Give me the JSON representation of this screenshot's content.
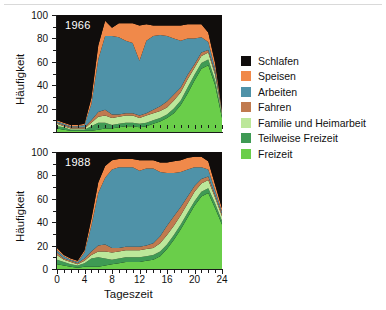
{
  "figure": {
    "panels": [
      {
        "id": "1966",
        "annotation": "1966"
      },
      {
        "id": "1988",
        "annotation": "1988"
      }
    ],
    "axes": {
      "xlabel": "Tageszeit",
      "ylabel": "Häufigkeit",
      "xticks": [
        0,
        4,
        8,
        12,
        16,
        20,
        24
      ],
      "yticks_top": [
        20,
        40,
        60,
        80,
        100
      ],
      "yticks_bottom": [
        0,
        20,
        40,
        60,
        80,
        100
      ],
      "xlim": [
        0,
        24
      ],
      "ylim": [
        0,
        100
      ]
    }
  },
  "legend": {
    "position": "right",
    "items": [
      {
        "label": "Schlafen",
        "color": "#100d0c"
      },
      {
        "label": "Speisen",
        "color": "#f0894a"
      },
      {
        "label": "Arbeiten",
        "color": "#4f92a8"
      },
      {
        "label": "Fahren",
        "color": "#c07a4f"
      },
      {
        "label": "Familie und Heimarbeit",
        "color": "#bce79a"
      },
      {
        "label": "Teilweise Freizeit",
        "color": "#3f9a54"
      },
      {
        "label": "Freizeit",
        "color": "#6ace4a"
      }
    ]
  },
  "chart_data": {
    "type": "area",
    "title": "",
    "xlabel": "Tageszeit",
    "ylabel": "Häufigkeit",
    "xlim": [
      0,
      24
    ],
    "ylim": [
      0,
      100
    ],
    "grid": false,
    "stacked": true,
    "stack_order_bottom_to_top": [
      "Freizeit",
      "Teilweise Freizeit",
      "Familie und Heimarbeit",
      "Fahren",
      "Arbeiten",
      "Speisen",
      "Schlafen"
    ],
    "x": [
      0,
      1,
      2,
      3,
      4,
      5,
      6,
      7,
      8,
      9,
      10,
      11,
      12,
      13,
      14,
      15,
      16,
      17,
      18,
      19,
      20,
      21,
      22,
      23,
      24
    ],
    "panels": [
      {
        "name": "1966",
        "annotation": "1966",
        "series": [
          {
            "name": "Freizeit",
            "values": [
              3,
              2,
              1,
              1,
              1,
              1,
              2,
              3,
              3,
              4,
              5,
              5,
              4,
              5,
              7,
              9,
              12,
              16,
              23,
              33,
              44,
              54,
              57,
              40,
              12
            ]
          },
          {
            "name": "Teilweise Freizeit",
            "values": [
              2,
              2,
              1,
              1,
              1,
              4,
              6,
              5,
              3,
              3,
              3,
              3,
              3,
              3,
              3,
              3,
              3,
              4,
              4,
              5,
              5,
              5,
              5,
              4,
              2
            ]
          },
          {
            "name": "Familie und Heimarbeit",
            "values": [
              2,
              1,
              1,
              1,
              1,
              3,
              5,
              6,
              6,
              6,
              6,
              6,
              5,
              6,
              6,
              6,
              6,
              7,
              7,
              7,
              6,
              6,
              6,
              5,
              2
            ]
          },
          {
            "name": "Fahren",
            "values": [
              1,
              1,
              1,
              1,
              1,
              2,
              4,
              5,
              3,
              2,
              2,
              2,
              2,
              2,
              3,
              4,
              5,
              5,
              4,
              4,
              3,
              3,
              2,
              2,
              1
            ]
          },
          {
            "name": "Arbeiten",
            "values": [
              1,
              1,
              1,
              1,
              2,
              14,
              45,
              63,
              67,
              66,
              62,
              60,
              47,
              62,
              63,
              61,
              56,
              48,
              40,
              31,
              22,
              13,
              7,
              3,
              1
            ]
          },
          {
            "name": "Speisen",
            "values": [
              1,
              1,
              1,
              1,
              1,
              5,
              12,
              13,
              7,
              12,
              15,
              17,
              30,
              14,
              9,
              8,
              9,
              11,
              13,
              12,
              12,
              11,
              8,
              5,
              1
            ]
          },
          {
            "name": "Schlafen",
            "values": [
              90,
              92,
              94,
              94,
              93,
              71,
              26,
              5,
              11,
              7,
              7,
              7,
              9,
              8,
              9,
              9,
              9,
              9,
              9,
              8,
              8,
              8,
              15,
              41,
              81
            ]
          }
        ]
      },
      {
        "name": "1988",
        "annotation": "1988",
        "series": [
          {
            "name": "Freizeit",
            "values": [
              4,
              3,
              2,
              1,
              2,
              2,
              2,
              3,
              4,
              5,
              6,
              6,
              6,
              7,
              8,
              11,
              17,
              25,
              34,
              44,
              54,
              62,
              65,
              52,
              38
            ]
          },
          {
            "name": "Teilweise Freizeit",
            "values": [
              4,
              3,
              2,
              2,
              3,
              7,
              8,
              6,
              4,
              4,
              4,
              4,
              4,
              4,
              4,
              4,
              4,
              4,
              4,
              4,
              4,
              4,
              4,
              4,
              3
            ]
          },
          {
            "name": "Familie und Heimarbeit",
            "values": [
              4,
              2,
              2,
              1,
              2,
              3,
              5,
              6,
              6,
              6,
              6,
              6,
              6,
              6,
              6,
              7,
              8,
              8,
              8,
              8,
              8,
              7,
              7,
              5,
              4
            ]
          },
          {
            "name": "Fahren",
            "values": [
              2,
              1,
              1,
              1,
              2,
              3,
              5,
              6,
              4,
              3,
              3,
              3,
              3,
              3,
              4,
              6,
              8,
              8,
              7,
              6,
              5,
              4,
              3,
              2,
              2
            ]
          },
          {
            "name": "Arbeiten",
            "values": [
              2,
              2,
              1,
              1,
              5,
              22,
              45,
              57,
              67,
              69,
              68,
              68,
              65,
              66,
              64,
              55,
              45,
              37,
              30,
              23,
              16,
              10,
              6,
              4,
              2
            ]
          },
          {
            "name": "Speisen",
            "values": [
              2,
              1,
              1,
              1,
              2,
              6,
              9,
              10,
              8,
              7,
              7,
              7,
              9,
              7,
              7,
              8,
              9,
              10,
              10,
              10,
              9,
              9,
              7,
              5,
              3
            ]
          },
          {
            "name": "Schlafen",
            "values": [
              82,
              88,
              91,
              93,
              84,
              57,
              26,
              12,
              7,
              6,
              6,
              6,
              7,
              7,
              7,
              9,
              9,
              8,
              7,
              5,
              4,
              4,
              8,
              28,
              48
            ]
          }
        ]
      }
    ]
  }
}
